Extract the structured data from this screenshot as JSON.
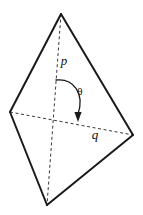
{
  "figure": {
    "shape_name": "tetrahedron",
    "stroke_color": "#1a1a1a",
    "hidden_edge_color": "#3a3a3a",
    "background_color": "#ffffff",
    "canvas": {
      "width": 143,
      "height": 215
    },
    "vertices": [
      {
        "id": "apex",
        "label": "",
        "x": 61,
        "y": 14
      },
      {
        "id": "left",
        "label": "",
        "x": 10,
        "y": 112
      },
      {
        "id": "right",
        "label": "",
        "x": 133,
        "y": 135
      },
      {
        "id": "bottom",
        "label": "",
        "x": 47,
        "y": 205
      }
    ],
    "solid_edges": [
      {
        "from": "apex",
        "to": "left"
      },
      {
        "from": "apex",
        "to": "right"
      },
      {
        "from": "left",
        "to": "bottom"
      },
      {
        "from": "right",
        "to": "bottom"
      }
    ],
    "hidden_edges": [
      {
        "from": "apex",
        "to": "bottom",
        "style": "dashed"
      },
      {
        "from": "left",
        "to": "right",
        "style": "dashed"
      }
    ],
    "labels": [
      {
        "id": "p-label",
        "text": "p",
        "x": 64,
        "y": 65,
        "style": "italic"
      },
      {
        "id": "theta-label",
        "text": "θ",
        "x": 78,
        "y": 95,
        "style": "greek"
      },
      {
        "id": "q-label",
        "text": "q",
        "x": 92,
        "y": 138,
        "style": "italic"
      }
    ],
    "angle_arc": {
      "id": "theta-arc",
      "description": "curved arrow sweeping clockwise from the p axis to the q axis",
      "path": "M 56,80 C 72,78 84,92 78,114",
      "arrow_tip": {
        "x": 78,
        "y": 121
      },
      "direction": "clockwise"
    }
  }
}
